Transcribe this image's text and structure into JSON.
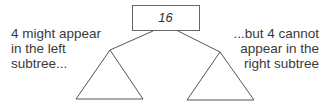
{
  "root": {
    "value": "16"
  },
  "annotations": {
    "left": [
      "4 might appear",
      "in the left",
      "subtree..."
    ],
    "right": [
      "...but 4 cannot",
      "appear in the",
      "right subtree"
    ]
  },
  "colors": {
    "stroke": "#555555",
    "text": "#3a3a3a",
    "box_fill": "#ffffff"
  }
}
